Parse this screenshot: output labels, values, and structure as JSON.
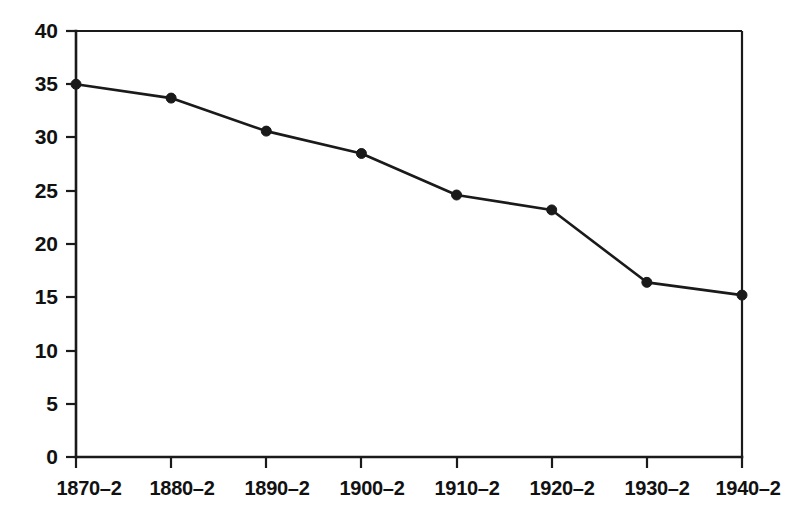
{
  "chart_data": {
    "type": "line",
    "title": "",
    "subtitle": "",
    "xlabel": "",
    "ylabel": "",
    "categories": [
      "1870–2",
      "1880–2",
      "1890–2",
      "1900–2",
      "1910–2",
      "1920–2",
      "1930–2",
      "1940–2"
    ],
    "values": [
      35.0,
      33.7,
      30.6,
      28.5,
      24.6,
      23.2,
      16.4,
      15.2
    ],
    "series": [
      {
        "name": "",
        "values": [
          35.0,
          33.7,
          30.6,
          28.5,
          24.6,
          23.2,
          16.4,
          15.2
        ]
      }
    ],
    "ylim": [
      0,
      40
    ],
    "yticks": [
      0,
      5,
      10,
      15,
      20,
      25,
      30,
      35,
      40
    ],
    "ytick_labels": [
      "0",
      "5",
      "10",
      "15",
      "20",
      "25",
      "30",
      "35",
      "40"
    ],
    "xtick_labels": [
      "1870–2",
      "1880–2",
      "1890–2",
      "1900–2",
      "1910–2",
      "1920–2",
      "1930–2",
      "1940–2"
    ],
    "grid": false,
    "legend": false,
    "legend_position": "none",
    "marker": "filled-circle",
    "line_color": "#1a1a1a",
    "marker_color": "#1a1a1a",
    "background_color": "#ffffff",
    "annotations": []
  },
  "axes": {
    "y_axis_name": "y-axis",
    "x_axis_name": "x-axis"
  }
}
